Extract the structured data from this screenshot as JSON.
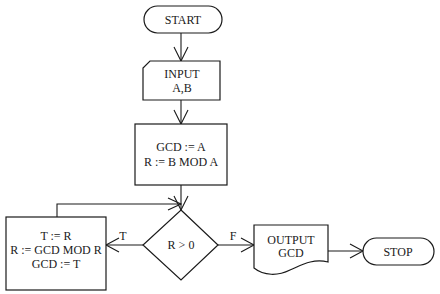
{
  "diagram": {
    "type": "flowchart",
    "nodes": {
      "start": {
        "shape": "terminator",
        "lines": [
          "START"
        ]
      },
      "input": {
        "shape": "input-card",
        "lines": [
          "INPUT",
          "A,B"
        ]
      },
      "init": {
        "shape": "process",
        "lines": [
          "GCD := A",
          "R := B MOD A"
        ]
      },
      "decision": {
        "shape": "decision",
        "lines": [
          "R > 0"
        ]
      },
      "loop_body": {
        "shape": "process",
        "lines": [
          "T := R",
          "R := GCD MOD R",
          "GCD := T"
        ]
      },
      "output": {
        "shape": "document",
        "lines": [
          "OUTPUT",
          "GCD"
        ]
      },
      "stop": {
        "shape": "terminator",
        "lines": [
          "STOP"
        ]
      }
    },
    "edges": [
      {
        "from": "start",
        "to": "input",
        "label": ""
      },
      {
        "from": "input",
        "to": "init",
        "label": ""
      },
      {
        "from": "init",
        "to": "decision",
        "label": ""
      },
      {
        "from": "decision",
        "to": "loop_body",
        "label": "T"
      },
      {
        "from": "loop_body",
        "to": "decision",
        "label": ""
      },
      {
        "from": "decision",
        "to": "output",
        "label": "F"
      },
      {
        "from": "output",
        "to": "stop",
        "label": ""
      }
    ],
    "colors": {
      "stroke": "#1a1a1a",
      "fill": "#ffffff",
      "background": "#ffffff"
    }
  }
}
